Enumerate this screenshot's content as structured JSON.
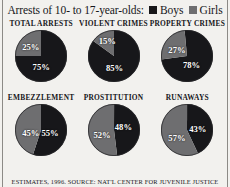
{
  "header": {
    "title": "Arrests of 10- to 17-year-olds:",
    "legend": [
      {
        "label": "Boys",
        "color": "#17171a",
        "swatch": "legend-swatch-boys"
      },
      {
        "label": "Girls",
        "color": "#6e6e70",
        "swatch": "legend-swatch-girls"
      }
    ]
  },
  "footer": {
    "source": "ESTIMATES, 1996. SOURCE: NAT'L CENTER FOR JUVENILE JUSTICE"
  },
  "colors": {
    "boys": "#17171a",
    "girls": "#6e6e70",
    "background": "#f2f1ee",
    "rule": "#8c8a86",
    "label_text": "#ffffff"
  },
  "chart_data": [
    {
      "type": "pie",
      "title": "TOTAL ARRESTS",
      "categories": [
        "Boys",
        "Girls"
      ],
      "values": [
        75,
        25
      ],
      "labels": [
        "75%",
        "25%"
      ],
      "colors": [
        "#17171a",
        "#6e6e70"
      ],
      "girls_start_deg": 270,
      "label_pos": [
        {
          "x": 50,
          "y": 72
        },
        {
          "x": 30,
          "y": 32
        }
      ]
    },
    {
      "type": "pie",
      "title": "VIOLENT CRIMES",
      "categories": [
        "Boys",
        "Girls"
      ],
      "values": [
        85,
        15
      ],
      "labels": [
        "85%",
        "15%"
      ],
      "colors": [
        "#17171a",
        "#6e6e70"
      ],
      "girls_start_deg": 306,
      "label_pos": [
        {
          "x": 52,
          "y": 74
        },
        {
          "x": 38,
          "y": 22
        }
      ]
    },
    {
      "type": "pie",
      "title": "PROPERTY CRIMES",
      "categories": [
        "Boys",
        "Girls"
      ],
      "values": [
        78,
        27
      ],
      "labels": [
        "78%",
        "27%"
      ],
      "colors": [
        "#17171a",
        "#6e6e70"
      ],
      "girls_start_deg": 262,
      "label_pos": [
        {
          "x": 58,
          "y": 68
        },
        {
          "x": 30,
          "y": 38
        }
      ]
    },
    {
      "type": "pie",
      "title": "EMBEZZLEMENT",
      "categories": [
        "Boys",
        "Girls"
      ],
      "values": [
        55,
        45
      ],
      "labels": [
        "55%",
        "45%"
      ],
      "colors": [
        "#17171a",
        "#6e6e70"
      ],
      "girls_start_deg": 198,
      "label_pos": [
        {
          "x": 67,
          "y": 55
        },
        {
          "x": 30,
          "y": 55
        }
      ]
    },
    {
      "type": "pie",
      "title": "PROSTITUTION",
      "categories": [
        "Boys",
        "Girls"
      ],
      "values": [
        48,
        52
      ],
      "labels": [
        "48%",
        "52%"
      ],
      "colors": [
        "#17171a",
        "#6e6e70"
      ],
      "girls_start_deg": 173,
      "label_pos": [
        {
          "x": 69,
          "y": 44
        },
        {
          "x": 28,
          "y": 60
        }
      ]
    },
    {
      "type": "pie",
      "title": "RUNAWAYS",
      "categories": [
        "Boys",
        "Girls"
      ],
      "values": [
        43,
        57
      ],
      "labels": [
        "43%",
        "57%"
      ],
      "colors": [
        "#17171a",
        "#6e6e70"
      ],
      "girls_start_deg": 155,
      "label_pos": [
        {
          "x": 70,
          "y": 48
        },
        {
          "x": 30,
          "y": 65
        }
      ]
    }
  ]
}
